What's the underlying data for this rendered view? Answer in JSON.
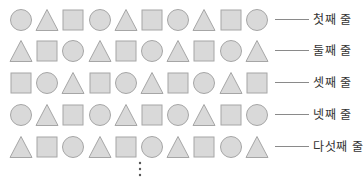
{
  "diagram": {
    "colors": {
      "fill": "#d9d9d9",
      "stroke": "#a6a6a6",
      "line": "#8a8a8a",
      "text": "#333333"
    },
    "rows": [
      {
        "label": "첫째 줄",
        "shapes": [
          "circle",
          "triangle",
          "square",
          "circle",
          "triangle",
          "square",
          "circle",
          "triangle",
          "square",
          "circle"
        ]
      },
      {
        "label": "둘째 줄",
        "shapes": [
          "triangle",
          "square",
          "circle",
          "triangle",
          "square",
          "circle",
          "triangle",
          "square",
          "circle",
          "triangle"
        ]
      },
      {
        "label": "셋째 줄",
        "shapes": [
          "square",
          "circle",
          "triangle",
          "square",
          "circle",
          "triangle",
          "square",
          "circle",
          "triangle",
          "square"
        ]
      },
      {
        "label": "넷째 줄",
        "shapes": [
          "circle",
          "triangle",
          "square",
          "circle",
          "triangle",
          "square",
          "circle",
          "triangle",
          "square",
          "circle"
        ]
      },
      {
        "label": "다섯째 줄",
        "shapes": [
          "triangle",
          "square",
          "circle",
          "triangle",
          "square",
          "circle",
          "triangle",
          "square",
          "circle",
          "triangle"
        ]
      }
    ],
    "continuation": "⋮"
  }
}
